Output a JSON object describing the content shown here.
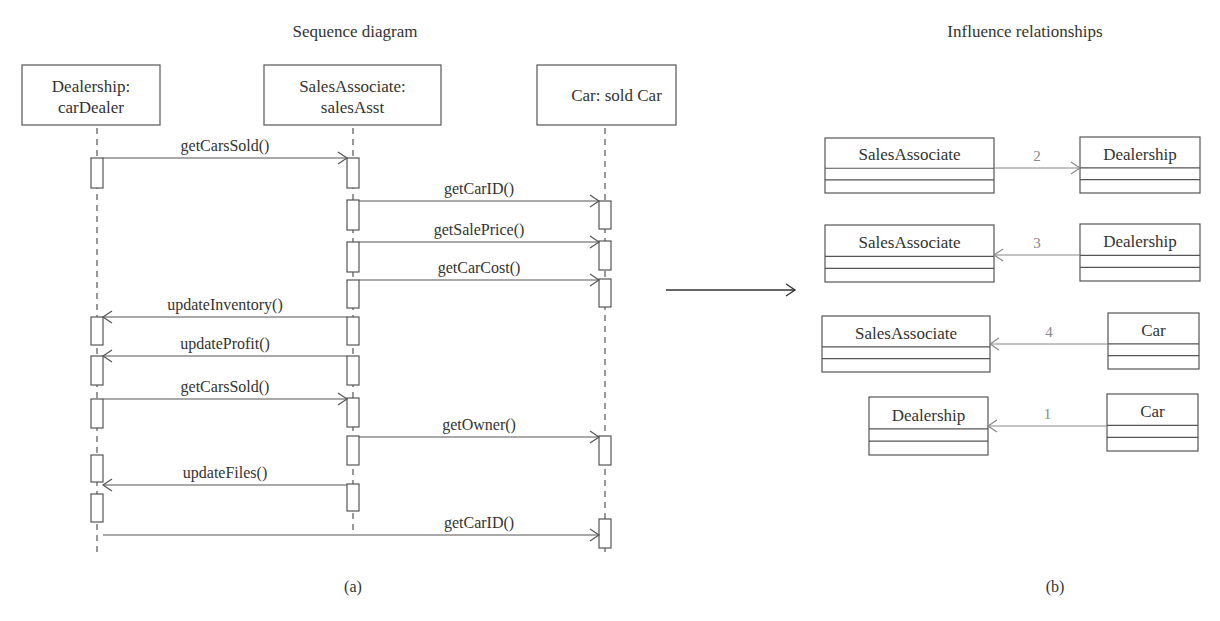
{
  "panel_a": {
    "title": "Sequence diagram",
    "caption": "(a)",
    "lifelines": [
      {
        "id": "dealer",
        "line1": "Dealership:",
        "line2": "carDealer",
        "box": [
          22,
          65,
          160,
          125
        ],
        "x": 97
      },
      {
        "id": "sales",
        "line1": "SalesAssociate:",
        "line2": "salesAsst",
        "box": [
          264,
          65,
          441,
          125
        ],
        "x": 353
      },
      {
        "id": "car",
        "line1": "Car: sold Car",
        "line2": "",
        "box": [
          537,
          65,
          676,
          125
        ],
        "x": 605
      }
    ],
    "activations": [
      {
        "x": 97,
        "y1": 158,
        "y2": 188
      },
      {
        "x": 97,
        "y1": 317,
        "y2": 345
      },
      {
        "x": 97,
        "y1": 356,
        "y2": 385
      },
      {
        "x": 97,
        "y1": 399,
        "y2": 428
      },
      {
        "x": 97,
        "y1": 455,
        "y2": 482
      },
      {
        "x": 97,
        "y1": 494,
        "y2": 522
      },
      {
        "x": 353,
        "y1": 158,
        "y2": 188
      },
      {
        "x": 353,
        "y1": 200,
        "y2": 230
      },
      {
        "x": 353,
        "y1": 242,
        "y2": 272
      },
      {
        "x": 353,
        "y1": 280,
        "y2": 308
      },
      {
        "x": 353,
        "y1": 317,
        "y2": 345
      },
      {
        "x": 353,
        "y1": 356,
        "y2": 385
      },
      {
        "x": 353,
        "y1": 398,
        "y2": 427
      },
      {
        "x": 353,
        "y1": 436,
        "y2": 465
      },
      {
        "x": 353,
        "y1": 484,
        "y2": 511
      },
      {
        "x": 605,
        "y1": 201,
        "y2": 229
      },
      {
        "x": 605,
        "y1": 241,
        "y2": 270
      },
      {
        "x": 605,
        "y1": 279,
        "y2": 307
      },
      {
        "x": 605,
        "y1": 436,
        "y2": 465
      },
      {
        "x": 605,
        "y1": 519,
        "y2": 548
      }
    ],
    "messages": [
      {
        "label": "getCarsSold()",
        "from": 97,
        "to": 353,
        "y": 158
      },
      {
        "label": "getCarID()",
        "from": 353,
        "to": 605,
        "y": 201
      },
      {
        "label": "getSalePrice()",
        "from": 353,
        "to": 605,
        "y": 242
      },
      {
        "label": "getCarCost()",
        "from": 353,
        "to": 605,
        "y": 280
      },
      {
        "label": "updateInventory()",
        "from": 353,
        "to": 97,
        "y": 317
      },
      {
        "label": "updateProfit()",
        "from": 353,
        "to": 97,
        "y": 356
      },
      {
        "label": "getCarsSold()",
        "from": 97,
        "to": 353,
        "y": 399
      },
      {
        "label": "getOwner()",
        "from": 353,
        "to": 605,
        "y": 437
      },
      {
        "label": "updateFiles()",
        "from": 353,
        "to": 97,
        "y": 485
      },
      {
        "label": "getCarID()",
        "from": 97,
        "to": 605,
        "y": 535
      }
    ]
  },
  "transition_arrow": {
    "x1": 666,
    "x2": 795,
    "y": 290
  },
  "panel_b": {
    "title": "Influence relationships",
    "caption": "(b)",
    "relations": [
      {
        "left": {
          "name": "SalesAssociate",
          "box": [
            825,
            138,
            994,
            193
          ]
        },
        "right": {
          "name": "Dealership",
          "box": [
            1080,
            137,
            1200,
            193
          ]
        },
        "number": "2",
        "direction": "right",
        "y": 168
      },
      {
        "left": {
          "name": "SalesAssociate",
          "box": [
            825,
            225,
            994,
            282
          ]
        },
        "right": {
          "name": "Dealership",
          "box": [
            1080,
            224,
            1200,
            281
          ]
        },
        "number": "3",
        "direction": "left",
        "y": 255
      },
      {
        "left": {
          "name": "SalesAssociate",
          "box": [
            822,
            316,
            990,
            372
          ]
        },
        "right": {
          "name": "Car",
          "box": [
            1108,
            313,
            1199,
            369
          ]
        },
        "number": "4",
        "direction": "left",
        "y": 344
      },
      {
        "left": {
          "name": "Dealership",
          "box": [
            869,
            397,
            988,
            455
          ]
        },
        "right": {
          "name": "Car",
          "box": [
            1107,
            394,
            1198,
            451
          ]
        },
        "number": "1",
        "direction": "left",
        "y": 426
      }
    ]
  }
}
